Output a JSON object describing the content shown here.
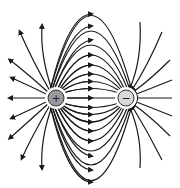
{
  "diagram": {
    "charges": [
      {
        "name": "positive",
        "symbol": "+",
        "cx": 56,
        "cy": 98,
        "r": 8,
        "fill": "#9a9a9a"
      },
      {
        "name": "negative",
        "symbol": "−",
        "cx": 126,
        "cy": 98,
        "r": 8,
        "fill": "#d9d9d9"
      }
    ],
    "colors": {
      "line": "#1a1a1a",
      "background": "#ffffff",
      "charge_stroke": "#333333"
    }
  }
}
